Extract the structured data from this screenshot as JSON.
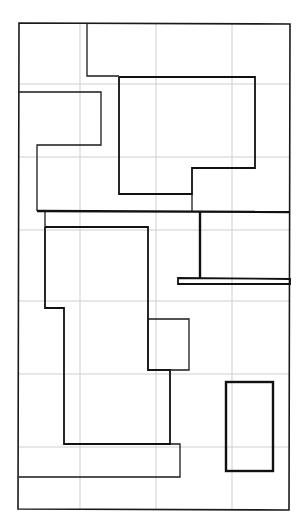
{
  "diagram": {
    "title": "",
    "colors": {
      "background": "#ffffff",
      "grid": "#cfcfcf",
      "stroke": "#111111"
    },
    "grid": {
      "columns": 4,
      "rows": 7
    },
    "regions": [
      {
        "id": "outer-frame",
        "kind": "border"
      },
      {
        "id": "top-corridor-outline",
        "kind": "outline"
      },
      {
        "id": "upper-right-room",
        "kind": "room"
      },
      {
        "id": "upper-left-room",
        "kind": "room"
      },
      {
        "id": "dividing-wall",
        "kind": "wall"
      },
      {
        "id": "right-annex-room",
        "kind": "room"
      },
      {
        "id": "ledge-bar",
        "kind": "wall"
      },
      {
        "id": "lower-main-room",
        "kind": "room"
      },
      {
        "id": "side-alcove",
        "kind": "room"
      },
      {
        "id": "bottom-strip",
        "kind": "room"
      },
      {
        "id": "bottom-right-box",
        "kind": "room"
      }
    ]
  }
}
